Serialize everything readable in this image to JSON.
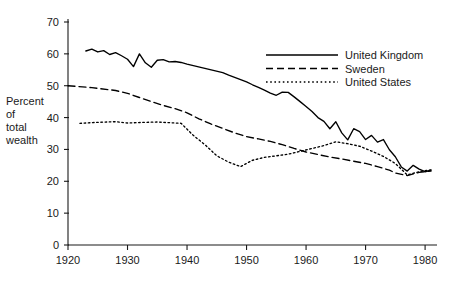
{
  "chart_data": {
    "type": "line",
    "title": "",
    "subtitle": "",
    "xlabel": "",
    "ylabel": "Percent of total wealth",
    "ylabel_lines": [
      "Percent",
      "of",
      "total",
      "wealth"
    ],
    "xlim": [
      1920,
      1982
    ],
    "ylim": [
      0,
      70
    ],
    "xticks": [
      1920,
      1930,
      1940,
      1950,
      1960,
      1970,
      1980
    ],
    "yticks": [
      0,
      10,
      20,
      30,
      40,
      50,
      60,
      70
    ],
    "xtick_labels": [
      "1920",
      "1930",
      "1940",
      "1950",
      "1960",
      "1970",
      "1980"
    ],
    "ytick_labels": [
      "0",
      "10",
      "20",
      "30",
      "40",
      "50",
      "60",
      "70"
    ],
    "grid": false,
    "legend_position": "top-right",
    "series": [
      {
        "name": "United Kingdom",
        "style": "solid",
        "color": "#000000",
        "x": [
          1923,
          1924,
          1925,
          1926,
          1927,
          1928,
          1929,
          1930,
          1931,
          1932,
          1933,
          1934,
          1935,
          1936,
          1937,
          1938,
          1939,
          1940,
          1946,
          1947,
          1948,
          1949,
          1950,
          1951,
          1952,
          1953,
          1954,
          1955,
          1956,
          1957,
          1958,
          1959,
          1960,
          1961,
          1962,
          1963,
          1964,
          1965,
          1966,
          1967,
          1968,
          1969,
          1970,
          1971,
          1972,
          1973,
          1974,
          1975,
          1976,
          1977,
          1978,
          1979,
          1980,
          1981
        ],
        "values": [
          60.9,
          61.5,
          60.6,
          61.0,
          59.8,
          60.4,
          59.4,
          58.3,
          56.0,
          60.0,
          57.2,
          55.8,
          58.0,
          58.2,
          57.5,
          57.6,
          57.3,
          56.8,
          54.1,
          53.3,
          52.6,
          51.9,
          51.2,
          50.3,
          49.5,
          48.6,
          47.7,
          47.0,
          48.0,
          47.9,
          46.5,
          45.0,
          43.5,
          41.9,
          40.0,
          38.8,
          36.5,
          38.7,
          35.2,
          33.0,
          36.5,
          35.6,
          33.1,
          34.4,
          32.3,
          33.1,
          29.9,
          27.7,
          24.5,
          23.2,
          25.0,
          23.8,
          23.0,
          23.5
        ]
      },
      {
        "name": "Sweden",
        "style": "dashed",
        "color": "#000000",
        "x": [
          1920,
          1924,
          1928,
          1930,
          1932,
          1934,
          1936,
          1938,
          1940,
          1942,
          1944,
          1946,
          1948,
          1950,
          1952,
          1954,
          1956,
          1958,
          1960,
          1962,
          1964,
          1966,
          1968,
          1970,
          1972,
          1974,
          1975,
          1977,
          1979,
          1981
        ],
        "values": [
          50.0,
          49.4,
          48.5,
          47.6,
          46.3,
          45.0,
          43.8,
          42.8,
          41.5,
          39.6,
          38.0,
          36.6,
          35.2,
          34.0,
          33.3,
          32.5,
          31.5,
          30.3,
          29.2,
          28.4,
          27.6,
          27.0,
          26.3,
          25.6,
          24.6,
          23.5,
          22.6,
          21.8,
          22.8,
          23.2
        ]
      },
      {
        "name": "United States",
        "style": "dotted",
        "color": "#000000",
        "x": [
          1922,
          1925,
          1928,
          1930,
          1933,
          1935,
          1937,
          1939,
          1941,
          1943,
          1945,
          1947,
          1949,
          1951,
          1953,
          1955,
          1957,
          1959,
          1961,
          1963,
          1965,
          1967,
          1969,
          1971,
          1973,
          1975,
          1977,
          1979,
          1981
        ],
        "values": [
          38.2,
          38.5,
          38.7,
          38.3,
          38.5,
          38.6,
          38.4,
          38.2,
          34.5,
          31.5,
          28.0,
          26.0,
          24.6,
          26.6,
          27.5,
          28.0,
          28.5,
          29.4,
          30.3,
          31.2,
          32.4,
          31.8,
          31.0,
          29.5,
          27.8,
          25.6,
          22.0,
          23.0,
          23.6
        ]
      }
    ],
    "legend": [
      {
        "label": "United Kingdom",
        "style": "solid"
      },
      {
        "label": "Sweden",
        "style": "dashed"
      },
      {
        "label": "United States",
        "style": "dotted"
      }
    ]
  }
}
